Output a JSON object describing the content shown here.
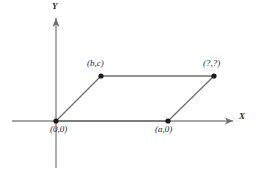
{
  "figure": {
    "background_color": "#ffffff",
    "line_color": "#6f6f6f",
    "axis_color": "#8a8a8a",
    "vertex_color": "#1a1a1a",
    "text_color": "#2b2b2b"
  },
  "axes": {
    "x_label": "X",
    "y_label": "Y",
    "x_axis": {
      "x1": 12,
      "y1": 121,
      "x2": 233,
      "y2": 121
    },
    "y_axis": {
      "x1": 56,
      "y1": 168,
      "x2": 56,
      "y2": 18
    }
  },
  "shape": {
    "type": "parallelogram",
    "vertices": [
      {
        "name": "origin",
        "label": "(0,0)",
        "x": 56,
        "y": 121,
        "label_x": 50,
        "label_y": 124
      },
      {
        "name": "base-right",
        "label": "(a,0)",
        "x": 168,
        "y": 121,
        "label_x": 155,
        "label_y": 124
      },
      {
        "name": "top-left",
        "label": "(b,c)",
        "x": 101,
        "y": 76,
        "label_x": 87,
        "label_y": 58
      },
      {
        "name": "top-right-unknown",
        "label": "(?,?)",
        "x": 214,
        "y": 76,
        "label_x": 203,
        "label_y": 58
      }
    ],
    "edges": [
      {
        "from": "origin",
        "to": "base-right"
      },
      {
        "from": "base-right",
        "to": "top-right-unknown"
      },
      {
        "from": "top-right-unknown",
        "to": "top-left"
      },
      {
        "from": "top-left",
        "to": "origin"
      }
    ]
  }
}
